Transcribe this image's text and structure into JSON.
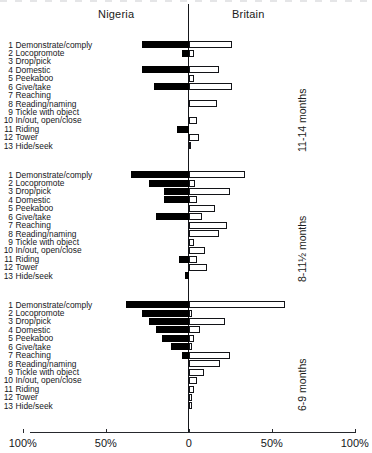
{
  "header": {
    "left_country": "Nigeria",
    "right_country": "Britain"
  },
  "axis": {
    "ticks": [
      "100%",
      "50%",
      "0",
      "50%",
      "100%"
    ],
    "tick_values": [
      -100,
      -50,
      0,
      50,
      100
    ]
  },
  "categories": [
    "Demonstrate/comply",
    "Locopromote",
    "Drop/pick",
    "Domestic",
    "Peekaboo",
    "Give/take",
    "Reaching",
    "Reading/naming",
    "Tickle with object",
    "In/out, open/close",
    "Riding",
    "Tower",
    "Hide/seek"
  ],
  "category_numbers": [
    "1",
    "2",
    "3",
    "4",
    "5",
    "6",
    "7",
    "8",
    "9",
    "10",
    "11",
    "12",
    "13"
  ],
  "sections": [
    {
      "caption": "11-14 months"
    },
    {
      "caption": "8-11½ months"
    },
    {
      "caption": "6-9 months"
    }
  ],
  "chart_data": {
    "type": "bar",
    "title": "",
    "subtitle": "",
    "orientation": "horizontal",
    "style": "back-to-back / bidirectional population pyramid",
    "xlabel": "",
    "ylabel": "",
    "xlim": [
      -100,
      100
    ],
    "xticks": [
      -100,
      -50,
      0,
      50,
      100
    ],
    "xtick_labels": [
      "100%",
      "50%",
      "0",
      "50%",
      "100%"
    ],
    "grid": false,
    "legend_position": "top (country headings above each half)",
    "units": "percent of mothers/infants showing the activity",
    "categories": [
      "Demonstrate/comply",
      "Locopromote",
      "Drop/pick",
      "Domestic",
      "Peekaboo",
      "Give/take",
      "Reaching",
      "Reading/naming",
      "Tickle with object",
      "In/out, open/close",
      "Riding",
      "Tower",
      "Hide/seek"
    ],
    "panels": [
      {
        "name": "11-14 months",
        "series": [
          {
            "name": "Nigeria",
            "side": "left",
            "color": "#000000",
            "values": [
              28,
              4,
              0,
              28,
              0,
              21,
              0,
              0,
              0,
              0,
              7,
              0,
              0
            ]
          },
          {
            "name": "Britain",
            "side": "right",
            "color": "#ffffff",
            "values": [
              26,
              3,
              0,
              18,
              3,
              26,
              0,
              17,
              0,
              5,
              0,
              6,
              1
            ]
          }
        ]
      },
      {
        "name": "8-11½ months",
        "series": [
          {
            "name": "Nigeria",
            "side": "left",
            "color": "#000000",
            "values": [
              35,
              24,
              15,
              15,
              0,
              20,
              0,
              0,
              0,
              0,
              6,
              0,
              2
            ]
          },
          {
            "name": "Britain",
            "side": "right",
            "color": "#ffffff",
            "values": [
              34,
              4,
              25,
              5,
              16,
              8,
              23,
              18,
              3,
              10,
              5,
              11,
              0
            ]
          }
        ]
      },
      {
        "name": "6-9 months",
        "series": [
          {
            "name": "Nigeria",
            "side": "left",
            "color": "#000000",
            "values": [
              38,
              28,
              24,
              20,
              16,
              11,
              4,
              0,
              0,
              0,
              0,
              0,
              0
            ]
          },
          {
            "name": "Britain",
            "side": "right",
            "color": "#ffffff",
            "values": [
              58,
              2,
              22,
              7,
              3,
              2,
              25,
              19,
              9,
              5,
              3,
              2,
              2
            ]
          }
        ]
      }
    ]
  }
}
